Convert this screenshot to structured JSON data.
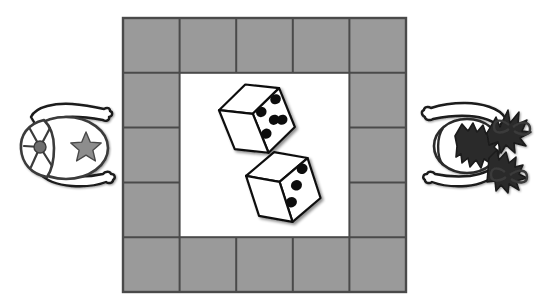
{
  "illustration": {
    "title": "Two players rolling dice on a square board game track",
    "background_color": "#ffffff",
    "ink_color": "#1a1a1a"
  },
  "board": {
    "name": "game-board",
    "x": 123,
    "y": 18,
    "width": 283,
    "height": 274,
    "columns": 5,
    "rows": 5,
    "cell_fill": "#9a9a9a",
    "center_fill": "#ffffff",
    "grid_stroke": "#4a4a4a",
    "outline_stroke": "#4a4a4a",
    "perimeter_space_count": 16,
    "center_label": ""
  },
  "dice": {
    "name": "dice-pair",
    "count": 2,
    "total": 8,
    "face_fill": "#ffffff",
    "pip_color": "#111111",
    "edge_color": "#111111",
    "items": [
      {
        "name": "die-top",
        "value": 5,
        "pip_layout": "quincunx",
        "rotation_deg": -22,
        "center_x": 256,
        "center_y": 119,
        "size": 62
      },
      {
        "name": "die-bottom",
        "value": 3,
        "pip_layout": "diagonal",
        "rotation_deg": -18,
        "center_x": 283,
        "center_y": 186,
        "size": 62
      }
    ]
  },
  "players": [
    {
      "name": "player-left",
      "label": "",
      "side": "left",
      "view": "top-down",
      "headwear": "baseball-cap",
      "cap_emblem": "star",
      "cap_fill": "#ffffff",
      "arm_count": 2,
      "center_x": 66,
      "center_y": 148
    },
    {
      "name": "player-right",
      "label": "",
      "side": "right",
      "view": "top-down",
      "headwear": "pigtails",
      "hair_bow_count": 2,
      "hair_fill": "#2a2a2a",
      "arm_count": 2,
      "center_x": 482,
      "center_y": 146
    }
  ]
}
